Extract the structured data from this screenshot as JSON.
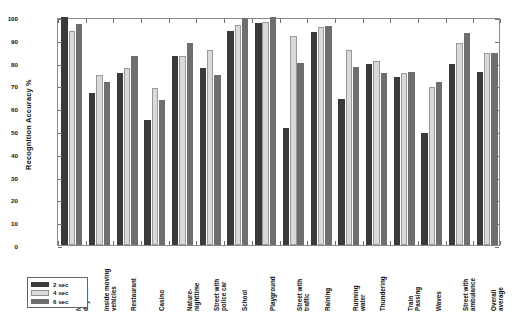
{
  "chart_data": {
    "type": "bar",
    "title": "",
    "xlabel": "",
    "ylabel": "Recognition Accuracy %",
    "ylim": [
      0,
      100
    ],
    "yticks": [
      0,
      10,
      20,
      30,
      40,
      50,
      60,
      70,
      80,
      90,
      100
    ],
    "grid": false,
    "legend_position": "bottom-left",
    "categories": [
      "Nature-\ndaytime",
      "Inside moving\nvehicles",
      "Restaurant",
      "Casino",
      "Nature-\nnighttime",
      "Street with\npolice car",
      "School",
      "Playground",
      "Street with\ntraffic",
      "Raining",
      "Running\nwater",
      "Thundering",
      "Train\nPassing",
      "Waves",
      "Street with\nambulance",
      "Overall\naverage"
    ],
    "series": [
      {
        "name": "2 sec",
        "color": "#3a3a3a",
        "values": [
          100,
          66.5,
          75.5,
          55.0,
          83.0,
          77.5,
          94.0,
          97.5,
          51.5,
          93.5,
          64.0,
          79.5,
          73.5,
          49.0,
          79.5,
          76.0
        ]
      },
      {
        "name": "4 sec",
        "color": "#d9d9d9",
        "values": [
          94.0,
          74.5,
          77.5,
          69.0,
          83.0,
          85.5,
          96.5,
          98.0,
          91.5,
          95.5,
          85.5,
          80.5,
          75.5,
          69.5,
          88.5,
          84.0
        ]
      },
      {
        "name": "6 sec",
        "color": "#6e6e6e",
        "values": [
          97.0,
          71.5,
          83.0,
          63.5,
          88.5,
          74.5,
          99.5,
          100.0,
          80.0,
          96.0,
          78.0,
          75.5,
          76.0,
          71.5,
          93.0,
          84.0
        ]
      }
    ],
    "legend": [
      "2 sec",
      "4 sec",
      "6 sec"
    ]
  }
}
